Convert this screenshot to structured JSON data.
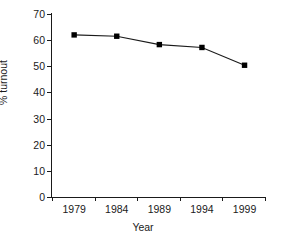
{
  "chart_data": {
    "type": "line",
    "title": "",
    "xlabel": "Year",
    "ylabel": "% turnout",
    "categories": [
      "1979",
      "1984",
      "1989",
      "1994",
      "1999"
    ],
    "x": [
      1979,
      1984,
      1989,
      1994,
      1999
    ],
    "values": [
      62.0,
      61.5,
      58.3,
      57.2,
      50.4
    ],
    "series": [
      {
        "name": "% turnout",
        "values": [
          62.0,
          61.5,
          58.3,
          57.2,
          50.4
        ]
      }
    ],
    "ylim": [
      0,
      70
    ],
    "ytick_labels": [
      "0",
      "10",
      "20",
      "30",
      "40",
      "50",
      "60",
      "70"
    ],
    "ytick_values": [
      0,
      10,
      20,
      30,
      40,
      50,
      60,
      70
    ],
    "xtick_labels": [
      "1979",
      "1984",
      "1989",
      "1994",
      "1999"
    ],
    "grid": false,
    "legend": false,
    "legend_position": "none",
    "marker": "filled-square",
    "colors": {
      "line": "#1a1a1a",
      "marker": "#000000",
      "axis": "#1a1a1a",
      "background": "#ffffff",
      "text": "#1a1a1a"
    }
  }
}
